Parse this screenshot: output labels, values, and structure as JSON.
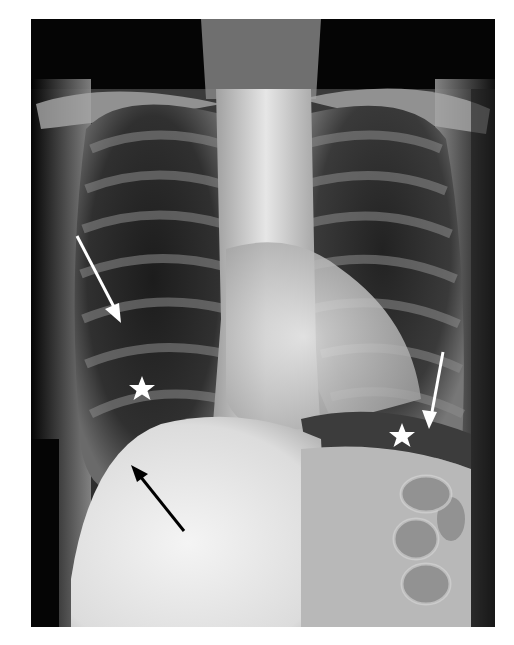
{
  "image": {
    "type": "chest-radiograph",
    "view": "frontal",
    "background": "#ffffff"
  },
  "annotations": {
    "arrows": [
      {
        "color": "#ffffff",
        "direction": "down-right",
        "side": "right-hemithorax"
      },
      {
        "color": "#000000",
        "direction": "up-left",
        "side": "right-hemidiaphragm"
      },
      {
        "color": "#ffffff",
        "direction": "down-left",
        "side": "left-hemithorax"
      }
    ],
    "stars": [
      {
        "color": "#ffffff",
        "side": "right-lower-zone"
      },
      {
        "color": "#ffffff",
        "side": "left-subdiaphragmatic"
      }
    ]
  }
}
